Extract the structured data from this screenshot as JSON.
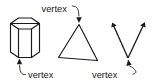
{
  "figure": {
    "background_color": "#ffffff",
    "line_color": "#1a1a1a",
    "hidden_line_color": "#9a9a9a",
    "width": 154,
    "height": 83
  },
  "labels": {
    "top": "vertex",
    "bottom_left": "vertex",
    "bottom_right": "vertex"
  },
  "shapes": {
    "prism": {
      "name": "hexagonal prism",
      "top_face_points": "10.5,23.5 18.5,18.0 31.5,18.0 39.5,23.5 31.5,29.0 18.5,29.0",
      "front_left_face": "10.5,23.5 18.5,29.0 18.5,57.5 10.5,52.0",
      "front_mid_face": "18.5,29.0 31.5,29.0 31.5,57.5 18.5,57.5",
      "front_right_face": "31.5,29.0 39.5,23.5 39.5,52.0 31.5,57.5",
      "hidden_back_top": "10.5,23.5 18.5,28.8 31.5,28.8 39.5,23.5",
      "hidden_back_vertical": "24.0,23.0 24.0,52.0",
      "hidden_back_left_vertical": "18.5,18.0 18.5,28.9",
      "hidden_back_right_vertical": "31.5,18.0 31.5,28.9",
      "bottom_edges": "10.5,52.0 18.5,57.5 31.5,57.5 39.5,52.0"
    },
    "triangle": {
      "name": "triangle",
      "points": "79.0,24.5 97.5,60.5 58.5,57.5"
    },
    "angle": {
      "name": "angle with two rays",
      "vertex": "128.0,58.0",
      "ray_left_end": "112.5,23.0",
      "ray_right_end": "144.5,22.5"
    }
  },
  "leaders": {
    "top": {
      "path": "M 73.0,6.0 C 77.5,6.0 78.5,9.0 78.8,15.5",
      "arrow_tip": "79.0,23.0"
    },
    "bottom_left": {
      "path": "M 25.0,74.5 C 21.0,74.5 20.0,71.5 19.6,65.0",
      "arrow_tip": "19.3,58.5"
    },
    "bottom_right": {
      "path": "M 134.0,74.0 C 138.0,74.0 138.8,71.0 129.2,66.0",
      "arrow_tip": "128.3,59.0"
    }
  },
  "label_positions": {
    "top": {
      "x": 41.5,
      "y": 11.5
    },
    "bottom_left": {
      "x": 28.0,
      "y": 77.5
    },
    "bottom_right": {
      "x": 92.0,
      "y": 77.5
    }
  }
}
